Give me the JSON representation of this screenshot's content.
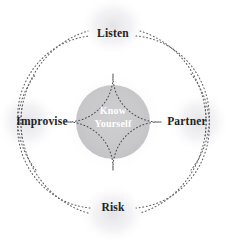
{
  "diagram": {
    "title": "Know Yourself",
    "type": "radial-cycle",
    "background_color": "#ffffff",
    "center": {
      "label_line1": "Know",
      "label_line2": "Yourself",
      "fill_color": "#c9c9c9",
      "text_color": "#ffffff"
    },
    "nodes": [
      {
        "id": "listen",
        "label": "Listen",
        "position": "top",
        "color": "#1f1f23"
      },
      {
        "id": "partner",
        "label": "Partner",
        "position": "right",
        "color": "#1f1f23"
      },
      {
        "id": "risk",
        "label": "Risk",
        "position": "bottom",
        "color": "#1f1f23"
      },
      {
        "id": "improvise",
        "label": "Improvise",
        "position": "left",
        "color": "#1f1f23"
      }
    ],
    "rings": {
      "outer_ring_color": "#5d5d62",
      "inner_ring_color": "#5d5d62",
      "star_color": "#4a4a50",
      "style": "dotted"
    },
    "halo_color": "#f0f0f2"
  }
}
